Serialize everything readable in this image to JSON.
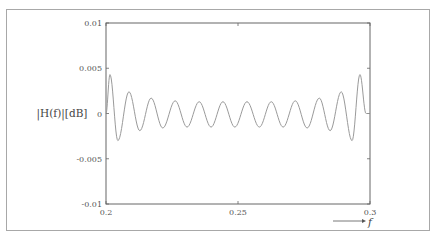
{
  "chart_data": {
    "type": "line",
    "title": "",
    "xlabel": "f",
    "ylabel": "|H(f)|[dB]",
    "xlim": [
      0.2,
      0.3
    ],
    "ylim": [
      -0.01,
      0.01
    ],
    "xticks": [
      0.2,
      0.25,
      0.3
    ],
    "xtick_labels": [
      "0.2",
      "0.25",
      "0.3"
    ],
    "yticks": [
      0.01,
      0.005,
      0,
      -0.005,
      -0.01
    ],
    "ytick_labels": [
      "0.01",
      "0.005",
      "0",
      "-0.005",
      "-0.01"
    ],
    "grid": false,
    "legend": null,
    "series": [
      {
        "name": "|H(f)|",
        "color": "#9a9a9a",
        "x": [
          0.2,
          0.2015,
          0.2045,
          0.2087,
          0.2128,
          0.2171,
          0.2215,
          0.2262,
          0.2307,
          0.2353,
          0.2398,
          0.2443,
          0.2488,
          0.2534,
          0.2581,
          0.2626,
          0.2671,
          0.2717,
          0.2762,
          0.2808,
          0.2849,
          0.2891,
          0.2932,
          0.2962,
          0.2985,
          0.3
        ],
        "y": [
          0.0,
          0.0043,
          -0.003,
          0.0024,
          -0.0019,
          0.0017,
          -0.0016,
          0.0014,
          -0.0015,
          0.0013,
          -0.0015,
          0.0013,
          -0.0015,
          0.0013,
          -0.0015,
          0.0013,
          -0.0015,
          0.0014,
          -0.0016,
          0.0017,
          -0.0019,
          0.0024,
          -0.003,
          0.0043,
          0.0,
          0.0
        ]
      }
    ]
  }
}
